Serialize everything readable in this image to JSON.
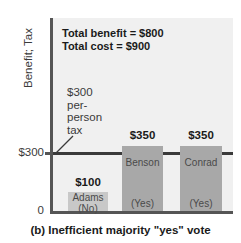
{
  "chart_data": {
    "type": "bar",
    "title": "",
    "caption": "(b) Inefficient majority \"yes\" vote",
    "ylabel": "Benefit; Tax",
    "xlabel": "",
    "ylim": [
      0,
      900
    ],
    "grid": false,
    "legend": "none",
    "categories": [
      "Adams",
      "Benson",
      "Conrad"
    ],
    "values": [
      100,
      350,
      350
    ],
    "value_labels": [
      "$100",
      "$350",
      "$350"
    ],
    "votes": [
      "(No)",
      "(Yes)",
      "(Yes)"
    ],
    "ytick_labels": [
      "0",
      "$300"
    ],
    "ytick_values": [
      0,
      300
    ],
    "reference_line": {
      "value": 300,
      "label_lines": [
        "$300",
        "per-",
        "person",
        "tax"
      ],
      "color": "#3a3a3a"
    },
    "annotations": {
      "total_benefit": "Total benefit = $800",
      "total_cost": "Total cost = $900"
    },
    "colors": {
      "plot_background": "#f0f0f0",
      "bar_low": "#c8c8c8",
      "bar_high": "#a8a8a8",
      "axis": "#555555",
      "text": "#1a1a1a"
    }
  },
  "bars": [
    {
      "name": "Adams",
      "value_label": "$100",
      "vote": "(No)",
      "left": 68,
      "width": 40,
      "height": 19,
      "color": "#c8c8c8",
      "value_top": 176,
      "name_top": 192,
      "vote_top": 203
    },
    {
      "name": "Benson",
      "value_label": "$350",
      "vote": "(Yes)",
      "left": 122,
      "width": 41,
      "height": 65,
      "color": "#a8a8a8",
      "value_top": 129,
      "name_top": 157,
      "vote_top": 198
    },
    {
      "name": "Conrad",
      "value_label": "$350",
      "vote": "(Yes)",
      "left": 180,
      "width": 42,
      "height": 65,
      "color": "#a8a8a8",
      "value_top": 129,
      "name_top": 157,
      "vote_top": 198
    }
  ]
}
